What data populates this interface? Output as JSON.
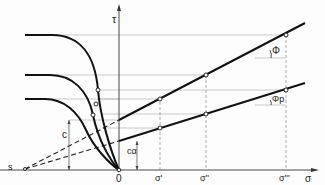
{
  "diagram": {
    "axes": {
      "y_label": "τ",
      "x_label": "σ",
      "origin_label": "0"
    },
    "x_ticks": [
      "σ'",
      "σ''",
      "σ'''"
    ],
    "left_point_label": "s",
    "cohesion_label": "c",
    "cohesion_p_label": "cα",
    "angle_labels": {
      "peak": "Φ",
      "residual": "Φp"
    },
    "colors": {
      "line": "#111111",
      "grid": "#9a9a9a",
      "background": "#fdfdfd"
    }
  }
}
